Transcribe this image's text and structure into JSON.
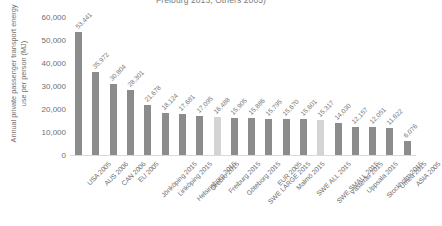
{
  "chart_data": {
    "type": "bar",
    "title": "Freiburg 2013, Others 2005)",
    "xlabel": "",
    "ylabel": "Annual private passenger transport energy use per person (MJ)",
    "ylim": [
      0,
      60000
    ],
    "yticks": [
      "60,000",
      "50,000",
      "40,000",
      "30,000",
      "20,000",
      "10,000",
      "0"
    ],
    "ytick_values": [
      60000,
      50000,
      40000,
      30000,
      20000,
      10000,
      0
    ],
    "grid": false,
    "legend": "none",
    "categories": [
      "USA 2005",
      "AUS 2006",
      "CAN 2006",
      "EU 2005",
      "Jönköping 2015",
      "Linköping 2015",
      "Helsingborg 2015",
      "Örebro 2015",
      "Freiburg 2015",
      "Göteborg 2015",
      "SWE LARGE 2015",
      "EUR 2005",
      "Malmö 2015",
      "SWE ALL 2015",
      "SWE SMALL 2015",
      "Västerås 2015",
      "Uppsala 2015",
      "Stockholm 2015",
      "Umeå 2015",
      "ASIA 2005"
    ],
    "values": [
      53441,
      35972,
      30804,
      28301,
      21678,
      18124,
      17681,
      17095,
      16488,
      15905,
      15886,
      15795,
      15670,
      15601,
      15317,
      14030,
      12157,
      12051,
      11622,
      6076
    ],
    "value_labels": [
      "53,441",
      "35,972",
      "30,804",
      "28,301",
      "21,678",
      "18,124",
      "17,681",
      "17,095",
      "16,488",
      "15,905",
      "15,886",
      "15,795",
      "15,670",
      "15,601",
      "15,317",
      "14,030",
      "12,157",
      "12,051",
      "11,622",
      "6,076"
    ],
    "bar_colors": [
      "#8c8c8c",
      "#8c8c8c",
      "#8c8c8c",
      "#8c8c8c",
      "#8c8c8c",
      "#8c8c8c",
      "#8c8c8c",
      "#8c8c8c",
      "#d4d4d4",
      "#8c8c8c",
      "#8c8c8c",
      "#8c8c8c",
      "#8c8c8c",
      "#8c8c8c",
      "#d4d4d4",
      "#8c8c8c",
      "#8c8c8c",
      "#8c8c8c",
      "#8c8c8c",
      "#8c8c8c"
    ],
    "colors": {
      "bar_default": "#8c8c8c",
      "bar_highlight": "#d4d4d4",
      "axis": "#d9d9d9",
      "text": "#6f6f6f",
      "background": "#ffffff"
    }
  }
}
